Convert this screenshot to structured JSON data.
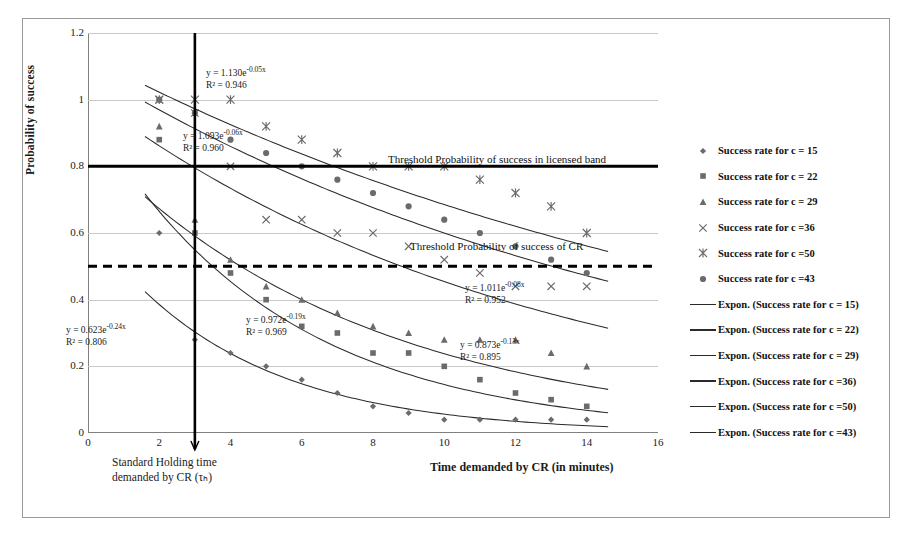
{
  "chart_data": {
    "type": "scatter",
    "title": "",
    "xlabel": "Time demanded by CR (in minutes)",
    "ylabel": "Probability of success",
    "xlim": [
      0,
      16
    ],
    "ylim": [
      0,
      1.2
    ],
    "xticks": [
      "0",
      "2",
      "4",
      "6",
      "8",
      "10",
      "12",
      "14",
      "16"
    ],
    "yticks": [
      "0",
      "0.2",
      "0.4",
      "0.6",
      "0.8",
      "1",
      "1.2"
    ],
    "grid": true,
    "legend_position": "right",
    "x": [
      2,
      3,
      4,
      5,
      6,
      7,
      8,
      9,
      10,
      11,
      12,
      13,
      14
    ],
    "series": [
      {
        "name": "Success rate for c = 15",
        "marker": "diamond",
        "values": [
          0.6,
          0.28,
          0.24,
          0.2,
          0.16,
          0.12,
          0.08,
          0.06,
          0.04,
          0.04,
          0.04,
          0.04,
          0.04
        ],
        "fit": "y = 0.623e^-0.24x",
        "r2": "R² = 0.806"
      },
      {
        "name": "Success rate for c = 22",
        "marker": "square",
        "values": [
          0.88,
          0.6,
          0.48,
          0.4,
          0.32,
          0.3,
          0.24,
          0.24,
          0.2,
          0.16,
          0.12,
          0.1,
          0.08
        ],
        "fit": "y = 0.972e^-0.19x",
        "r2": "R² = 0.969"
      },
      {
        "name": "Success rate for c = 29",
        "marker": "triangle",
        "values": [
          0.92,
          0.64,
          0.52,
          0.44,
          0.4,
          0.36,
          0.32,
          0.3,
          0.28,
          0.28,
          0.28,
          0.24,
          0.2
        ],
        "fit": "y = 0.873e^-0.13x",
        "r2": "R² = 0.895"
      },
      {
        "name": "Success rate for c =36",
        "marker": "cross",
        "values": [
          1.0,
          0.96,
          0.8,
          0.64,
          0.64,
          0.6,
          0.6,
          0.56,
          0.52,
          0.48,
          0.44,
          0.44,
          0.44
        ],
        "fit": "y = 1.011e^-0.08x",
        "r2": "R² = 0.952"
      },
      {
        "name": "Success rate for c =50",
        "marker": "star",
        "values": [
          1.0,
          1.0,
          1.0,
          0.92,
          0.88,
          0.84,
          0.8,
          0.8,
          0.8,
          0.76,
          0.72,
          0.68,
          0.6
        ],
        "fit": "y = 1.130e^-0.05x",
        "r2": "R² = 0.946"
      },
      {
        "name": "Success rate for c =43",
        "marker": "circle",
        "values": [
          1.0,
          0.96,
          0.88,
          0.84,
          0.8,
          0.76,
          0.72,
          0.68,
          0.64,
          0.6,
          0.56,
          0.52,
          0.48
        ],
        "fit": "y = 1.093e^-0.06x",
        "r2": "R² = 0.960"
      }
    ],
    "annotations": [
      {
        "text": "Threshold Probability of success in licensed band",
        "y": 0.8,
        "style": "solid"
      },
      {
        "text": "Threshold Probability of success of CR",
        "y": 0.5,
        "style": "dashed"
      },
      {
        "text": "Standard Holding time demanded by CR (τₕ)",
        "x": 3,
        "style": "vertical"
      }
    ]
  },
  "equations": [
    {
      "id": "eq-c50",
      "line1": "y = 1.130e",
      "exp": "-0.05x",
      "line2": "R² = 0.946"
    },
    {
      "id": "eq-c43",
      "line1": "y = 1.093e",
      "exp": "-0.06x",
      "line2": "R² = 0.960"
    },
    {
      "id": "eq-c15",
      "line1": "y = 0.623e",
      "exp": "-0.24x",
      "line2": "R² = 0.806"
    },
    {
      "id": "eq-c22",
      "line1": "y = 0.972e",
      "exp": "-0.19x",
      "line2": "R² = 0.969"
    },
    {
      "id": "eq-c36",
      "line1": "y = 1.011e",
      "exp": "-0.08x",
      "line2": "R² = 0.952"
    },
    {
      "id": "eq-c29",
      "line1": "y = 0.873e",
      "exp": "-0.13x",
      "line2": "R² = 0.895"
    }
  ],
  "thresholds": {
    "licensed_band": "Threshold Probability of success in licensed band",
    "cr": "Threshold Probability of success of CR"
  },
  "axes": {
    "x_title": "Time demanded by CR (in minutes)",
    "y_title": "Probability of success",
    "holding_line1": "Standard Holding time",
    "holding_line2": "demanded by CR (τₕ)",
    "xticks": [
      "0",
      "2",
      "4",
      "6",
      "8",
      "10",
      "12",
      "14",
      "16"
    ],
    "yticks": [
      "1.2",
      "1",
      "0.8",
      "0.6",
      "0.4",
      "0.2",
      "0"
    ]
  },
  "legend": {
    "items": [
      {
        "label": "Success rate for c = 15",
        "marker": "diamond"
      },
      {
        "label": "Success rate for c = 22",
        "marker": "square"
      },
      {
        "label": "Success rate for c = 29",
        "marker": "triangle"
      },
      {
        "label": "Success rate for c =36",
        "marker": "cross"
      },
      {
        "label": "Success rate for c =50",
        "marker": "star"
      },
      {
        "label": "Success rate for c =43",
        "marker": "circle"
      },
      {
        "label": "Expon. (Success rate for c = 15)",
        "marker": "line"
      },
      {
        "label": "Expon. (Success rate for c = 22)",
        "marker": "line"
      },
      {
        "label": "Expon. (Success rate for c = 29)",
        "marker": "line"
      },
      {
        "label": "Expon. (Success rate for c =36)",
        "marker": "line"
      },
      {
        "label": "Expon. (Success rate for c =50)",
        "marker": "line"
      },
      {
        "label": "Expon. (Success rate for c =43)",
        "marker": "line"
      }
    ]
  },
  "colors": {
    "marker": "#6b6b6b",
    "trend": "#2b2b2b",
    "grid": "#c9c9c9",
    "axis": "#808080",
    "threshold": "#000000"
  }
}
